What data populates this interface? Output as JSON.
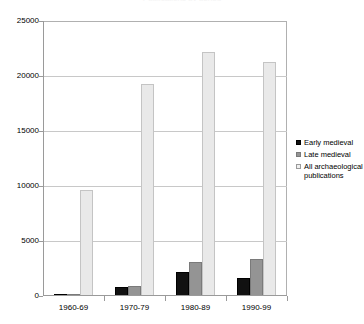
{
  "chart_data": {
    "type": "bar",
    "title": "Publications by period",
    "xlabel": "",
    "ylabel": "",
    "categories": [
      "1960-69",
      "1970-79",
      "1980-89",
      "1990-99"
    ],
    "series": [
      {
        "name": "Early medieval",
        "color": "#111111",
        "values": [
          100,
          800,
          2150,
          1650
        ]
      },
      {
        "name": "Late medieval",
        "color": "#949494",
        "values": [
          150,
          900,
          3100,
          3350
        ]
      },
      {
        "name": "All archaeological publications",
        "color": "#e9e9e9",
        "values": [
          9650,
          19300,
          22200,
          21300
        ]
      }
    ],
    "ylim": [
      0,
      25000
    ],
    "yticks": [
      0,
      5000,
      10000,
      15000,
      20000,
      25000
    ],
    "ytick_labels": [
      "0",
      "5000",
      "10000",
      "15000",
      "20000",
      "25000"
    ],
    "grid": "horizontal",
    "legend_position": "right"
  },
  "legend": {
    "entries": [
      "Early medieval",
      "Late medieval",
      "All archaeological publications"
    ]
  }
}
